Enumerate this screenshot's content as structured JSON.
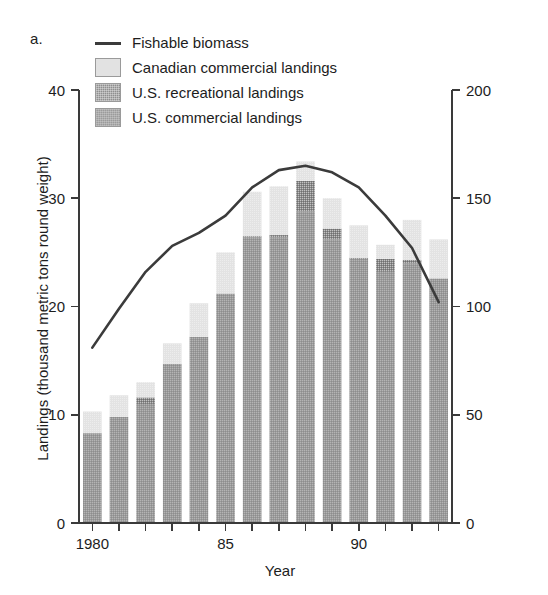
{
  "panel_label": "a.",
  "legend": {
    "items": [
      {
        "label": "Fishable biomass",
        "kind": "line",
        "icon": "line-segment-icon",
        "color": "#3b3b3b"
      },
      {
        "label": "Canadian commercial landings",
        "kind": "swatch",
        "icon": "legend-swatch-icon",
        "color": "#e2e2e2"
      },
      {
        "label": "U.S. recreational landings",
        "kind": "swatch",
        "icon": "legend-swatch-icon",
        "color": "#8f8f8f"
      },
      {
        "label": "U.S. commercial landings",
        "kind": "swatch",
        "icon": "legend-swatch-icon",
        "color": "#9b9b9b"
      }
    ]
  },
  "axes": {
    "left_title": "Landings (thousand metric tons round weight)",
    "right_title": "Biomass (thousand metric tons round weight)",
    "bottom_title": "Year",
    "left_ticks": [
      "0",
      "10",
      "20",
      "30",
      "40"
    ],
    "right_ticks": [
      "0",
      "50",
      "100",
      "150",
      "200"
    ],
    "bottom_ticks": [
      "1980",
      "85",
      "90"
    ]
  },
  "chart_data": {
    "type": "bar",
    "title": "",
    "subtitle": "",
    "xlabel": "Year",
    "ylabel": "Landings (thousand metric tons round weight)",
    "y2label": "Biomass (thousand metric tons round weight)",
    "ylim": [
      0,
      40
    ],
    "y2lim": [
      0,
      200
    ],
    "yticks": [
      0,
      10,
      20,
      30,
      40
    ],
    "y2ticks": [
      0,
      50,
      100,
      150,
      200
    ],
    "grid": false,
    "legend_position": "top-left",
    "stacked": true,
    "categories": [
      1980,
      1981,
      1982,
      1983,
      1984,
      1985,
      1986,
      1987,
      1988,
      1989,
      1990,
      1991,
      1992,
      1993
    ],
    "xtick_labels": [
      "1980",
      "",
      "",
      "",
      "",
      "85",
      "",
      "",
      "",
      "",
      "90",
      "",
      "",
      ""
    ],
    "series": [
      {
        "name": "U.S. commercial landings",
        "values": [
          8.3,
          9.8,
          11.0,
          14.7,
          17.2,
          21.2,
          26.4,
          26.4,
          28.8,
          26.2,
          24.4,
          23.2,
          24.0,
          22.6
        ]
      },
      {
        "name": "U.S. recreational landings",
        "values": [
          0.0,
          0.0,
          0.6,
          0.0,
          0.0,
          0.0,
          0.1,
          0.2,
          2.8,
          1.0,
          0.1,
          1.2,
          0.3,
          0.0
        ]
      },
      {
        "name": "Canadian commercial landings",
        "values": [
          2.0,
          2.0,
          1.4,
          1.9,
          3.1,
          3.8,
          4.1,
          4.5,
          1.8,
          2.8,
          3.0,
          1.3,
          3.7,
          3.6
        ]
      }
    ],
    "totals": [
      10.3,
      11.8,
      13.0,
      16.6,
      20.3,
      25.0,
      30.6,
      31.1,
      33.4,
      30.0,
      27.5,
      25.7,
      28.0,
      26.2
    ],
    "line_series": {
      "name": "Fishable biomass",
      "axis": "right",
      "x": [
        1980,
        1981,
        1982,
        1983,
        1984,
        1985,
        1986,
        1987,
        1988,
        1989,
        1990,
        1991,
        1992,
        1993
      ],
      "values": [
        81,
        99,
        116,
        128,
        134,
        142,
        155,
        163,
        165,
        162,
        155,
        142,
        127,
        102
      ],
      "color": "#3b3b3b"
    }
  }
}
